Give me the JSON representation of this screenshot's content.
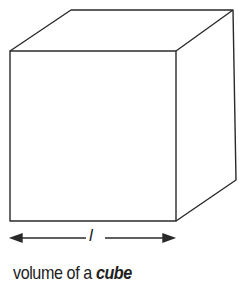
{
  "diagram": {
    "shape": "cube",
    "dimension_label": "l",
    "caption_prefix": "volume of a ",
    "caption_emphasis": "cube",
    "colors": {
      "stroke": "#2a2a2a",
      "background": "#ffffff"
    }
  }
}
